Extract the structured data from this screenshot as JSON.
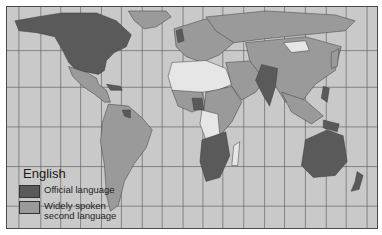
{
  "map": {
    "title": "English",
    "colors": {
      "ocean": "#c9c9c9",
      "official": "#5a5a5a",
      "second": "#9a9a9a",
      "none": "#e6e6e6",
      "border": "#3c3c3c",
      "grid": "#555555"
    },
    "legend": {
      "title": "English",
      "items": [
        {
          "label": "Official language",
          "color": "#5a5a5a"
        },
        {
          "label": "Widely spoken second language",
          "color": "#9a9a9a"
        }
      ]
    }
  }
}
